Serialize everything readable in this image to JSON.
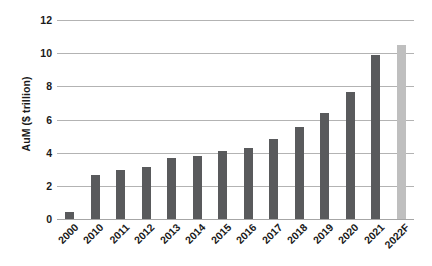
{
  "chart_data": {
    "type": "bar",
    "title": "",
    "xlabel": "",
    "ylabel": "AuM ($ trillion)",
    "categories": [
      "2000",
      "2010",
      "2011",
      "2012",
      "2013",
      "2014",
      "2015",
      "2016",
      "2017",
      "2018",
      "2019",
      "2020",
      "2021",
      "2022F"
    ],
    "values": [
      0.4,
      2.65,
      2.95,
      3.15,
      3.7,
      3.8,
      4.1,
      4.3,
      4.85,
      5.55,
      6.4,
      7.65,
      9.9,
      10.5
    ],
    "bar_colors": [
      "#595A5C",
      "#595A5C",
      "#595A5C",
      "#595A5C",
      "#595A5C",
      "#595A5C",
      "#595A5C",
      "#595A5C",
      "#595A5C",
      "#595A5C",
      "#595A5C",
      "#595A5C",
      "#595A5C",
      "#BFBFBF"
    ],
    "ylim": [
      0,
      12
    ],
    "ytick_values": [
      0,
      2,
      4,
      6,
      8,
      10,
      12
    ],
    "ytick_labels": [
      "0",
      "2",
      "4",
      "6",
      "8",
      "10",
      "12"
    ],
    "grid": true,
    "grid_axis": "y",
    "legend": false,
    "legend_position": "none",
    "annotations": []
  },
  "colors": {
    "bar_actual": "#595A5C",
    "bar_forecast": "#BFBFBF",
    "gridline": "#b3b3b3",
    "axis_text": "#1a1a1a",
    "background": "#ffffff"
  }
}
